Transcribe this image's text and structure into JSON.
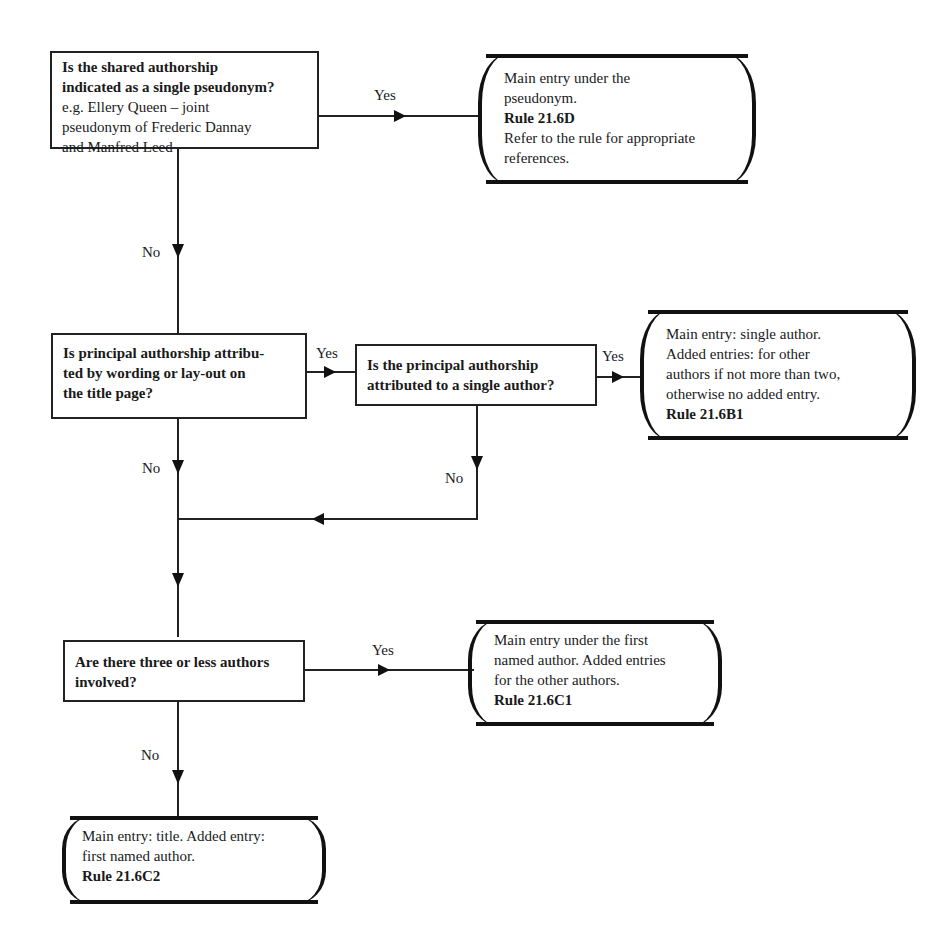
{
  "diagram": {
    "type": "flowchart",
    "decisions": [
      {
        "id": "q1",
        "question": "Is the shared authorship indicated as a single pseudonym?",
        "question_lines": [
          "Is the shared authorship",
          "indicated as a single pseudonym?"
        ],
        "example_lines": [
          "e.g. Ellery Queen – joint",
          "pseudonym of Frederic Dannay",
          "and Manfred Leed"
        ]
      },
      {
        "id": "q2",
        "question_lines": [
          "Is principal authorship attribu-",
          "ted by wording or lay-out on",
          "the title page?"
        ]
      },
      {
        "id": "q3",
        "question_lines": [
          "Is the principal authorship",
          "attributed to a single author?"
        ]
      },
      {
        "id": "q4",
        "question_lines": [
          "Are there three or less authors",
          "involved?"
        ]
      }
    ],
    "outcomes": [
      {
        "id": "o1",
        "lines": [
          "Main entry under the",
          "pseudonym."
        ],
        "rule": "Rule 21.6D",
        "after_lines": [
          "Refer to the rule for appropriate",
          "references."
        ]
      },
      {
        "id": "o2",
        "lines": [
          "Main entry: single author.",
          "Added entries: for other",
          "authors if not more than two,",
          "otherwise no added entry."
        ],
        "rule": "Rule 21.6B1"
      },
      {
        "id": "o3",
        "lines": [
          "Main entry under the first",
          "named author. Added entries",
          "for the other authors."
        ],
        "rule": "Rule 21.6C1"
      },
      {
        "id": "o4",
        "lines": [
          "Main entry: title. Added entry:",
          "first named author."
        ],
        "rule": "Rule 21.6C2"
      }
    ],
    "edge_labels": {
      "q1_yes": "Yes",
      "q1_no": "No",
      "q2_yes": "Yes",
      "q2_no": "No",
      "q3_yes": "Yes",
      "q3_no": "No",
      "q4_yes": "Yes",
      "q4_no": "No"
    },
    "edges": [
      {
        "from": "q1",
        "to": "o1",
        "label": "Yes"
      },
      {
        "from": "q1",
        "to": "q2",
        "label": "No"
      },
      {
        "from": "q2",
        "to": "q3",
        "label": "Yes"
      },
      {
        "from": "q2",
        "to": "q4",
        "label": "No"
      },
      {
        "from": "q3",
        "to": "o2",
        "label": "Yes"
      },
      {
        "from": "q3",
        "to": "q4",
        "label": "No"
      },
      {
        "from": "q4",
        "to": "o3",
        "label": "Yes"
      },
      {
        "from": "q4",
        "to": "o4",
        "label": "No"
      }
    ]
  }
}
